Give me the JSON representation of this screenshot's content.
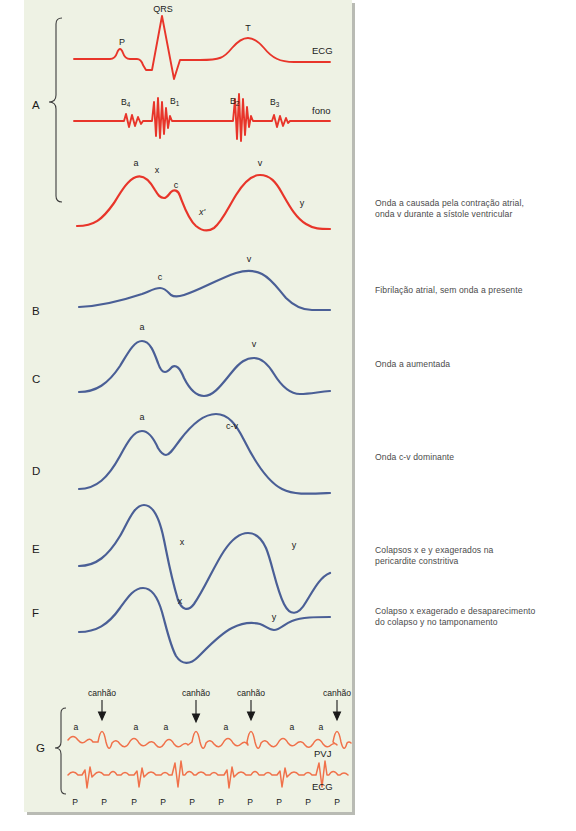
{
  "figure": {
    "background_color": "#eef2e4",
    "red_color": "#e8352a",
    "blue_color": "#4a5f96",
    "orange_color": "#f0714a"
  },
  "panel_a": {
    "letter": "A",
    "ecg": {
      "trace_label": "ECG",
      "waves": [
        "P",
        "QRS",
        "T"
      ]
    },
    "phono": {
      "trace_label": "fono",
      "sounds": [
        {
          "base": "B",
          "sub": "4"
        },
        {
          "base": "B",
          "sub": "1"
        },
        {
          "base": "B",
          "sub": "2"
        },
        {
          "base": "B",
          "sub": "3"
        }
      ]
    },
    "jvp_labels": [
      "a",
      "x",
      "c",
      "x'",
      "v",
      "y"
    ],
    "caption": "Onda a causada pela contração atrial,\nonda v durante a sístole ventricular",
    "caption_line1": "Onda a causada pela contração atrial,",
    "caption_line2": "onda v durante a sístole ventricular"
  },
  "panel_b": {
    "letter": "B",
    "jvp_labels": [
      "c",
      "v"
    ],
    "caption_line1": "Fibrilação atrial, sem onda a presente"
  },
  "panel_c": {
    "letter": "C",
    "jvp_labels": [
      "a",
      "v"
    ],
    "caption_line1": "Onda a aumentada"
  },
  "panel_d": {
    "letter": "D",
    "jvp_labels": [
      "a",
      "c-v"
    ],
    "caption_line1": "Onda c-v dominante"
  },
  "panel_e": {
    "letter": "E",
    "jvp_labels": [
      "x",
      "y"
    ],
    "caption_line1": "Colapsos x e y exagerados na",
    "caption_line2": "pericardite constritiva"
  },
  "panel_f": {
    "letter": "F",
    "jvp_labels": [
      "x",
      "y"
    ],
    "caption_line1": "Colapso x exagerado e desaparecimento",
    "caption_line2": "do colapso y no tamponamento"
  },
  "panel_g": {
    "letter": "G",
    "pvj_trace_label": "PVJ",
    "ecg_trace_label": "ECG",
    "cannon_labels": [
      "canhão",
      "canhão",
      "canhão",
      "canhão"
    ],
    "a_wave_labels": [
      "a",
      "a",
      "a",
      "a",
      "a",
      "a",
      "a"
    ],
    "p_wave_labels": [
      "P",
      "P",
      "P",
      "P",
      "P",
      "P",
      "P",
      "P",
      "P",
      "P"
    ]
  }
}
